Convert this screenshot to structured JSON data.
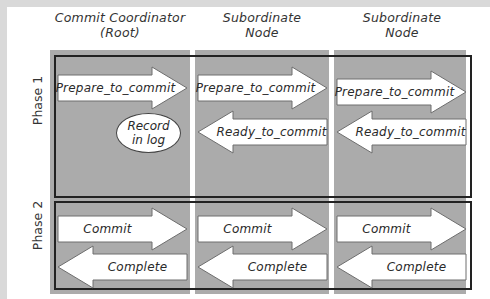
{
  "diagram": {
    "columns": [
      {
        "title_line1": "Commit Coordinator",
        "title_line2": "(Root)"
      },
      {
        "title_line1": "Subordinate",
        "title_line2": "Node"
      },
      {
        "title_line1": "Subordinate",
        "title_line2": "Node"
      }
    ],
    "phases": [
      {
        "label": "Phase 1",
        "rows": [
          {
            "direction": "right",
            "cells": [
              "Prepare_to_commit",
              "Prepare_to_commit",
              "Prepare_to_commit"
            ]
          },
          {
            "direction": "left",
            "cells": [
              null,
              "Ready_to_commit",
              "Ready_to_commit"
            ]
          }
        ],
        "note": {
          "line1": "Record",
          "line2": "in log"
        }
      },
      {
        "label": "Phase 2",
        "rows": [
          {
            "direction": "right",
            "cells": [
              "Commit",
              "Commit",
              "Commit"
            ]
          },
          {
            "direction": "left",
            "cells": [
              "Complete",
              "Complete",
              "Complete"
            ]
          }
        ]
      }
    ],
    "colors": {
      "panel": "#ababab",
      "arrow_fill": "#ffffff",
      "arrow_stroke": "#6e6e6e",
      "phase_border": "#222222",
      "frame": "#d9d9d9"
    }
  }
}
